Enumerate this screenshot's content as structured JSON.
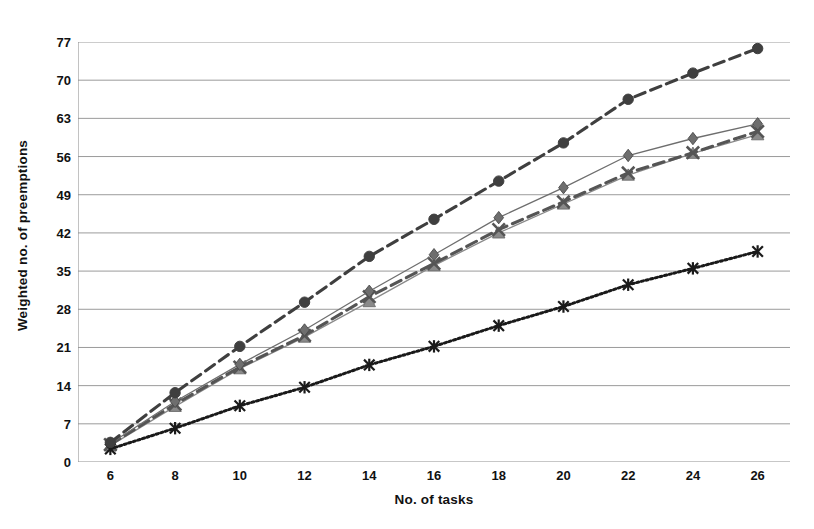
{
  "chart_data": {
    "type": "line",
    "title": "",
    "xlabel": "No. of tasks",
    "ylabel": "Weighted no. of preemptions",
    "x": [
      6,
      8,
      10,
      12,
      14,
      16,
      18,
      20,
      22,
      24,
      26
    ],
    "xlim": [
      5,
      27
    ],
    "ylim": [
      0,
      77
    ],
    "yticks": [
      0,
      7,
      14,
      21,
      28,
      35,
      42,
      49,
      56,
      63,
      70,
      77
    ],
    "xticks": [
      6,
      8,
      10,
      12,
      14,
      16,
      18,
      20,
      22,
      24,
      26
    ],
    "grid": "horizontal",
    "legend": "none",
    "series": [
      {
        "name": "series-circle-dashed",
        "marker": "circle",
        "line": "dashed",
        "color": "#3f3f3f",
        "values": [
          3.6,
          12.7,
          21.2,
          29.3,
          37.7,
          44.5,
          51.5,
          58.5,
          66.5,
          71.3,
          75.8
        ]
      },
      {
        "name": "series-diamond",
        "marker": "diamond",
        "line": "solid",
        "color": "#6e6e6e",
        "values": [
          3.4,
          11.1,
          17.9,
          24.2,
          31.3,
          38.0,
          44.8,
          50.3,
          56.2,
          59.3,
          62.0
        ]
      },
      {
        "name": "series-x-dashed",
        "marker": "x",
        "line": "dashed",
        "color": "#555555",
        "values": [
          3.2,
          10.6,
          17.4,
          23.2,
          30.3,
          36.4,
          42.6,
          47.7,
          53.0,
          56.7,
          60.6
        ]
      },
      {
        "name": "series-triangle",
        "marker": "triangle",
        "line": "solid",
        "color": "#8a8a8a",
        "values": [
          3.0,
          10.2,
          17.1,
          22.9,
          29.4,
          36.0,
          42.0,
          47.3,
          52.6,
          56.6,
          60.0
        ]
      },
      {
        "name": "series-star-dotted",
        "marker": "star",
        "line": "dotted",
        "color": "#1a1a1a",
        "values": [
          2.4,
          6.2,
          10.3,
          13.7,
          17.8,
          21.2,
          25.0,
          28.5,
          32.5,
          35.5,
          38.6
        ]
      }
    ]
  }
}
